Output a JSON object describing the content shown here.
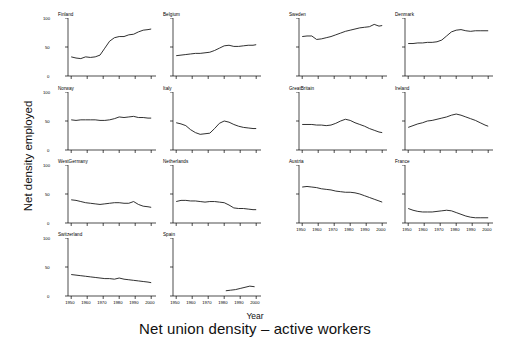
{
  "figure": {
    "title": "Net union density – active workers",
    "xlabel": "Year",
    "ylabel": "Net density employed",
    "line_color": "#1a1a1a",
    "axis_color": "#000000",
    "background": "#ffffff"
  },
  "axes": {
    "x_ticks": [
      "1950",
      "1960",
      "1970",
      "1980",
      "1990",
      "2000"
    ],
    "y_ticks": [
      "0",
      "50",
      "100"
    ],
    "xlim": [
      1948,
      2003
    ],
    "ylim": [
      0,
      100
    ]
  },
  "chart_data": {
    "type": "line",
    "title": "Net union density – active workers",
    "xlabel": "Year",
    "ylabel": "Net density employed",
    "xlim": [
      1948,
      2003
    ],
    "ylim": [
      0,
      100
    ],
    "x_ticks": [
      1950,
      1960,
      1970,
      1980,
      1990,
      2000
    ],
    "y_ticks": [
      0,
      50,
      100
    ],
    "grid": false,
    "legend": "none",
    "layout": {
      "rows": 4,
      "cols": 4,
      "panels": 14
    },
    "panels": [
      {
        "name": "Finland",
        "row": 1,
        "col": 1,
        "x": [
          1950,
          1953,
          1956,
          1959,
          1962,
          1965,
          1968,
          1971,
          1974,
          1977,
          1980,
          1983,
          1986,
          1989,
          1992,
          1995,
          1998,
          2000
        ],
        "y": [
          33,
          31,
          30,
          33,
          32,
          33,
          36,
          48,
          60,
          66,
          68,
          68,
          71,
          72,
          76,
          79,
          80,
          81
        ]
      },
      {
        "name": "Belgium",
        "row": 1,
        "col": 2,
        "x": [
          1950,
          1953,
          1956,
          1959,
          1962,
          1965,
          1968,
          1971,
          1974,
          1977,
          1980,
          1983,
          1986,
          1989,
          1992,
          1995,
          1998,
          2000
        ],
        "y": [
          35,
          36,
          37,
          38,
          39,
          39,
          40,
          41,
          44,
          48,
          52,
          53,
          51,
          51,
          52,
          53,
          53,
          54
        ]
      },
      {
        "name": "Sweden",
        "row": 1,
        "col": 3,
        "x": [
          1950,
          1953,
          1956,
          1959,
          1962,
          1965,
          1968,
          1971,
          1974,
          1977,
          1980,
          1983,
          1986,
          1989,
          1992,
          1995,
          1998,
          2000
        ],
        "y": [
          68,
          69,
          69,
          63,
          64,
          66,
          68,
          71,
          74,
          77,
          79,
          81,
          83,
          84,
          85,
          89,
          86,
          87
        ]
      },
      {
        "name": "Denmark",
        "row": 1,
        "col": 4,
        "x": [
          1950,
          1953,
          1956,
          1959,
          1962,
          1965,
          1968,
          1971,
          1974,
          1977,
          1980,
          1983,
          1986,
          1989,
          1992,
          1995,
          1998,
          2000
        ],
        "y": [
          56,
          56,
          57,
          57,
          58,
          58,
          59,
          62,
          69,
          76,
          79,
          80,
          78,
          77,
          78,
          78,
          78,
          78
        ]
      },
      {
        "name": "Norway",
        "row": 2,
        "col": 1,
        "x": [
          1950,
          1953,
          1956,
          1959,
          1962,
          1965,
          1968,
          1971,
          1974,
          1977,
          1980,
          1983,
          1986,
          1989,
          1992,
          1995,
          1998,
          2000
        ],
        "y": [
          52,
          51,
          52,
          52,
          52,
          52,
          51,
          51,
          52,
          54,
          57,
          56,
          57,
          58,
          56,
          56,
          55,
          55
        ]
      },
      {
        "name": "Italy",
        "row": 2,
        "col": 2,
        "x": [
          1950,
          1953,
          1956,
          1959,
          1962,
          1965,
          1968,
          1971,
          1974,
          1977,
          1980,
          1983,
          1986,
          1989,
          1992,
          1995,
          1998,
          2000
        ],
        "y": [
          47,
          45,
          42,
          35,
          30,
          27,
          28,
          29,
          37,
          46,
          50,
          48,
          44,
          41,
          39,
          38,
          37,
          37
        ]
      },
      {
        "name": "GreatBritain",
        "row": 2,
        "col": 3,
        "x": [
          1950,
          1953,
          1956,
          1959,
          1962,
          1965,
          1968,
          1971,
          1974,
          1977,
          1980,
          1983,
          1986,
          1989,
          1992,
          1995,
          1998,
          2000
        ],
        "y": [
          44,
          44,
          44,
          43,
          43,
          42,
          43,
          46,
          50,
          53,
          51,
          47,
          44,
          41,
          37,
          34,
          31,
          30
        ]
      },
      {
        "name": "Ireland",
        "row": 2,
        "col": 4,
        "x": [
          1950,
          1953,
          1956,
          1959,
          1962,
          1965,
          1968,
          1971,
          1974,
          1977,
          1980,
          1983,
          1986,
          1989,
          1992,
          1995,
          1998,
          2000
        ],
        "y": [
          39,
          42,
          45,
          47,
          50,
          51,
          53,
          55,
          57,
          60,
          62,
          60,
          57,
          54,
          51,
          47,
          43,
          41
        ]
      },
      {
        "name": "WestGermany",
        "row": 3,
        "col": 1,
        "x": [
          1950,
          1953,
          1956,
          1959,
          1962,
          1965,
          1968,
          1971,
          1974,
          1977,
          1980,
          1983,
          1986,
          1989,
          1992,
          1995,
          1998,
          2000
        ],
        "y": [
          40,
          39,
          37,
          35,
          34,
          33,
          32,
          33,
          34,
          35,
          35,
          34,
          34,
          37,
          32,
          29,
          28,
          27
        ]
      },
      {
        "name": "Netherlands",
        "row": 3,
        "col": 2,
        "x": [
          1950,
          1953,
          1956,
          1959,
          1962,
          1965,
          1968,
          1971,
          1974,
          1977,
          1980,
          1983,
          1986,
          1989,
          1992,
          1995,
          1998,
          2000
        ],
        "y": [
          37,
          39,
          39,
          38,
          38,
          37,
          36,
          37,
          37,
          36,
          35,
          31,
          26,
          25,
          25,
          24,
          23,
          23
        ]
      },
      {
        "name": "Austria",
        "row": 3,
        "col": 3,
        "x": [
          1950,
          1953,
          1956,
          1959,
          1962,
          1965,
          1968,
          1971,
          1974,
          1977,
          1980,
          1983,
          1986,
          1989,
          1992,
          1995,
          1998,
          2000
        ],
        "y": [
          62,
          63,
          62,
          61,
          59,
          58,
          57,
          55,
          54,
          53,
          53,
          52,
          50,
          47,
          44,
          41,
          38,
          36
        ]
      },
      {
        "name": "France",
        "row": 3,
        "col": 4,
        "x": [
          1950,
          1953,
          1956,
          1959,
          1962,
          1965,
          1968,
          1971,
          1974,
          1977,
          1980,
          1983,
          1986,
          1989,
          1992,
          1995,
          1998,
          2000
        ],
        "y": [
          25,
          22,
          20,
          19,
          19,
          19,
          20,
          21,
          22,
          21,
          18,
          15,
          12,
          10,
          9,
          9,
          9,
          9
        ]
      },
      {
        "name": "Switzerland",
        "row": 4,
        "col": 1,
        "x": [
          1950,
          1953,
          1956,
          1959,
          1962,
          1965,
          1968,
          1971,
          1974,
          1977,
          1980,
          1983,
          1986,
          1989,
          1992,
          1995,
          1998,
          2000
        ],
        "y": [
          37,
          36,
          35,
          34,
          33,
          32,
          31,
          30,
          30,
          29,
          31,
          29,
          28,
          27,
          26,
          25,
          24,
          23
        ]
      },
      {
        "name": "Spain",
        "row": 4,
        "col": 2,
        "x": [
          1981,
          1984,
          1987,
          1990,
          1993,
          1996,
          1999
        ],
        "y": [
          9,
          10,
          11,
          13,
          15,
          17,
          16
        ]
      }
    ]
  }
}
